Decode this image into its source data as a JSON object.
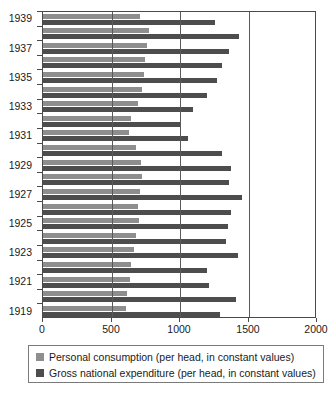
{
  "chart_data": {
    "type": "bar",
    "orientation": "horizontal",
    "title": "",
    "subtitle": "",
    "xlabel": "",
    "ylabel": "",
    "xlim": [
      0,
      2000
    ],
    "ylim": [
      1919,
      1939
    ],
    "grid": true,
    "legend_position": "bottom",
    "xticks": [
      0,
      500,
      1000,
      1500,
      2000
    ],
    "xtick_labels": [
      "0",
      "500",
      "1000",
      "1500",
      "2000"
    ],
    "categories": [
      1939,
      1938,
      1937,
      1936,
      1935,
      1934,
      1933,
      1932,
      1931,
      1930,
      1929,
      1928,
      1927,
      1926,
      1925,
      1924,
      1923,
      1922,
      1921,
      1920,
      1919
    ],
    "ytick_labels": [
      "1939",
      "1937",
      "1935",
      "1933",
      "1931",
      "1929",
      "1927",
      "1925",
      "1923",
      "1921",
      "1919"
    ],
    "series": [
      {
        "name": "Personal consumption (per head, in constant values)",
        "color": "#8e8e8e",
        "values": [
          710,
          775,
          760,
          745,
          740,
          720,
          690,
          640,
          625,
          680,
          715,
          720,
          705,
          695,
          700,
          680,
          665,
          640,
          635,
          610,
          605
        ]
      },
      {
        "name": "Gross national expenditure (per head, in constant values)",
        "color": "#4d4d4d",
        "values": [
          1255,
          1430,
          1360,
          1310,
          1270,
          1200,
          1095,
          1000,
          1060,
          1310,
          1375,
          1360,
          1455,
          1375,
          1350,
          1335,
          1420,
          1195,
          1210,
          1410,
          1290
        ]
      }
    ]
  },
  "legend": {
    "entries": [
      {
        "label": "Personal consumption (per head, in constant values)",
        "swatch_name": "legend-swatch-personal-consumption",
        "color": "#8e8e8e"
      },
      {
        "label": "Gross national expenditure (per head, in constant values)",
        "swatch_name": "legend-swatch-gross-national-expenditure",
        "color": "#4d4d4d"
      }
    ]
  }
}
